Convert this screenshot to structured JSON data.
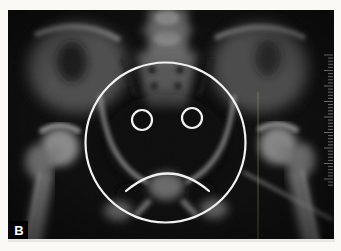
{
  "figure": {
    "panel_label": "B",
    "annotation_name": "sad-face-overlay"
  },
  "colors": {
    "photo_background": "#faf9f6",
    "film_black": "#0d0d0d",
    "annotation_stroke": "#f2f2f2",
    "label_bg": "#000000",
    "label_text": "#ffffff",
    "ruler_tick": "#9a9a9a",
    "artifact_line": "#b7ad7a"
  },
  "annotation": {
    "face_circle": {
      "cx": 165.5,
      "cy": 142.5,
      "r": 80
    },
    "left_eye": {
      "cx": 142,
      "cy": 120,
      "r": 10
    },
    "right_eye": {
      "cx": 192,
      "cy": 118,
      "r": 10
    },
    "frown": {
      "x1": 126,
      "y1": 191,
      "cx": 168,
      "cy": 156,
      "x2": 209,
      "y2": 191
    },
    "stroke_width": 2.2
  },
  "ruler": {
    "x_edge": 333,
    "y_start": 55,
    "y_end": 186,
    "spacing": 3.1,
    "minor_len": 5,
    "major_len": 9,
    "major_every": 5
  }
}
